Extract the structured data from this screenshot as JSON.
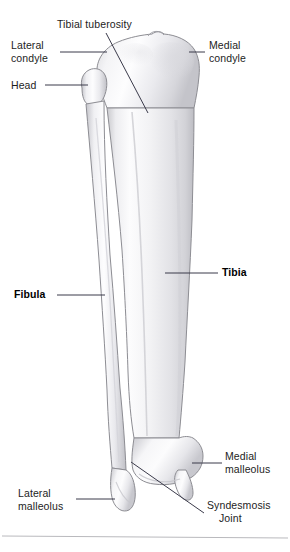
{
  "figure": {
    "view": "anterior",
    "background_color": "#ffffff",
    "text_color": "#1d1d1d",
    "leader_line_color": "#3a3a4a",
    "bone_outline_color": "#8d8d93",
    "bone_fill_color": "#f7f7f8",
    "divider_color": "#b9b9bd"
  },
  "labels": {
    "tibial_tuberosity": "Tibial tuberosity",
    "lateral_condyle": "Lateral\ncondyle",
    "head": "Head",
    "medial_condyle": "Medial\ncondyle",
    "tibia": "Tibia",
    "fibula": "Fibula",
    "medial_malleolus": "Medial\nmalleolus",
    "lateral_malleolus": "Lateral\nmalleolus",
    "syndesmosis_line1": "Syndesmosis",
    "syndesmosis_line2": "Joint"
  },
  "structures": [
    {
      "name": "tibia",
      "label": "Tibia",
      "emphasis": "bold",
      "side": "medial"
    },
    {
      "name": "fibula",
      "label": "Fibula",
      "emphasis": "bold",
      "side": "lateral"
    },
    {
      "name": "tibial-tuberosity",
      "label": "Tibial tuberosity",
      "emphasis": "regular"
    },
    {
      "name": "lateral-condyle",
      "label": "Lateral condyle",
      "emphasis": "regular"
    },
    {
      "name": "medial-condyle",
      "label": "Medial condyle",
      "emphasis": "regular"
    },
    {
      "name": "fibular-head",
      "label": "Head",
      "emphasis": "regular"
    },
    {
      "name": "medial-malleolus",
      "label": "Medial malleolus",
      "emphasis": "regular"
    },
    {
      "name": "lateral-malleolus",
      "label": "Lateral malleolus",
      "emphasis": "regular"
    },
    {
      "name": "syndesmosis-joint",
      "label": "Syndesmosis Joint",
      "emphasis": "regular"
    }
  ]
}
